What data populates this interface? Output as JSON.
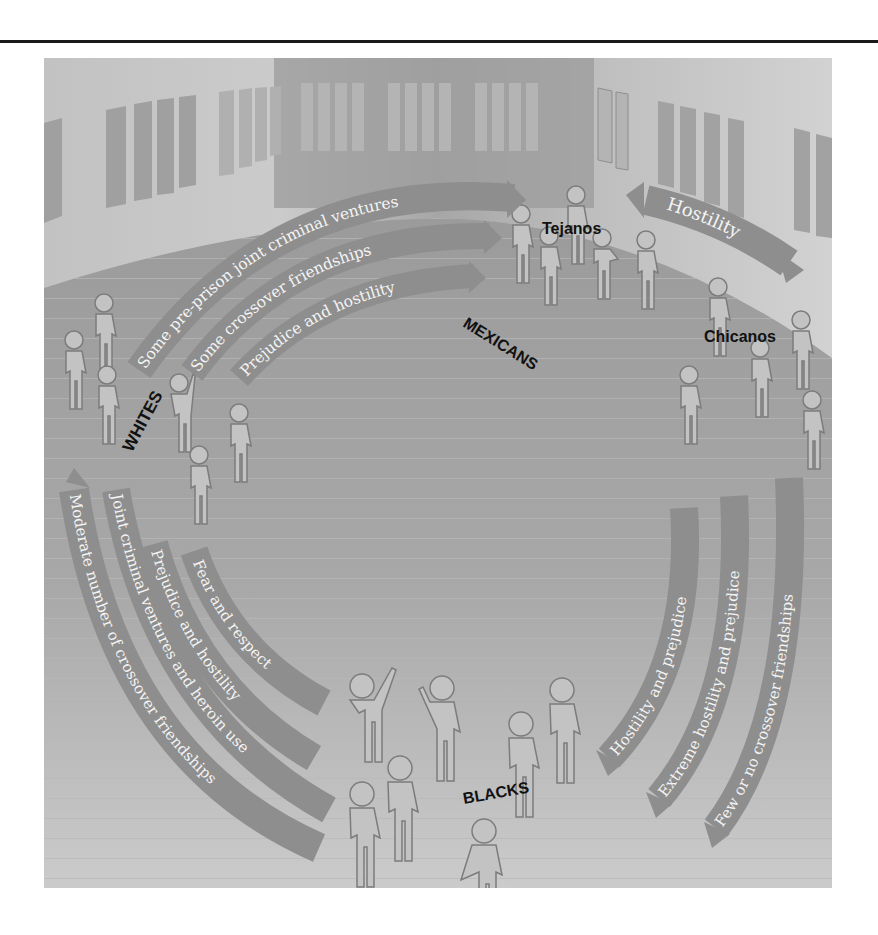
{
  "colors": {
    "page_bg": "#ffffff",
    "rule": "#1a1a1a",
    "wall_light": "#c9c9c9",
    "wall_mid": "#a9a9a9",
    "wall_dark": "#999999",
    "window": "#b6b6b6",
    "window_dark": "#9a9a9a",
    "floor": "#a3a3a3",
    "floor_light": "#c4c4c4",
    "arrow_fill": "#8e8e8e",
    "arrow_stroke": "#6e6e6e",
    "arrow_text": "#f4f4f4",
    "figure_fill": "#c2c2c2",
    "figure_stroke": "#7c7c7c",
    "label": "#111111"
  },
  "groups": {
    "whites": "WHITES",
    "mexicans": "MEXICANS",
    "tejanos": "Tejanos",
    "chicanos": "Chicanos",
    "blacks": "BLACKS"
  },
  "relations": {
    "whites_to_mexicans": [
      "Some pre-prison joint criminal ventures",
      "Some crossover friendships",
      "Prejudice and hostility"
    ],
    "chicanos_to_tejanos": [
      "Hostility"
    ],
    "whites_to_blacks": [
      "Moderate number of crossover friendships",
      "Joint criminal ventures and heroin use",
      "Prejudice and hostility",
      "Fear and respect"
    ],
    "blacks_to_mexicans": [
      "Hostility and prejudice",
      "Extreme hostility and prejudice",
      "Few or no crossover friendships"
    ]
  }
}
